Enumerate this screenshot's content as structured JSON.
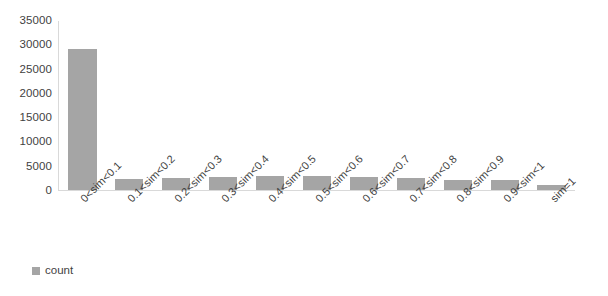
{
  "chart_data": {
    "type": "bar",
    "title": "",
    "subtitle": "",
    "xlabel": "",
    "ylabel": "",
    "grid": false,
    "legend_position": "bottom-left",
    "bar_color": "#a5a5a5",
    "axis_color": "#d9d9d9",
    "text_color": "#3f3f3f",
    "ylim": [
      0,
      35000
    ],
    "ytick_step": 5000,
    "ytick_labels": [
      "0",
      "5000",
      "10000",
      "15000",
      "20000",
      "25000",
      "30000",
      "35000"
    ],
    "ytick_values": [
      0,
      5000,
      10000,
      15000,
      20000,
      25000,
      30000,
      35000
    ],
    "categories": [
      "0<sim<0.1",
      "0.1<sim<0.2",
      "0.2<sim<0.3",
      "0.3<sim<0.4",
      "0.4<sim<0.5",
      "0.5<sim<0.6",
      "0.6<sim<0.7",
      "0.7<sim<0.8",
      "0.8<sim<0.9",
      "0.9<sim<1",
      "sim=1"
    ],
    "series": [
      {
        "name": "count",
        "values": [
          29000,
          2300,
          2400,
          2700,
          2800,
          2800,
          2600,
          2400,
          2100,
          2100,
          1000
        ]
      }
    ],
    "legend": [
      "count"
    ]
  }
}
